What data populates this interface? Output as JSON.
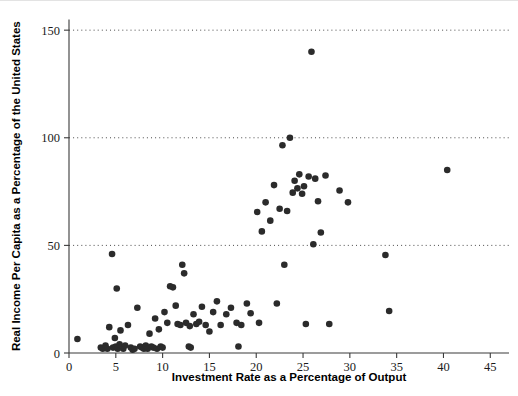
{
  "chart_data": {
    "type": "scatter",
    "title": "",
    "xlabel": "Investment Rate as a Percentage of Output",
    "ylabel": "Real Income Per Capita as a Percentage of the United States",
    "xlim": [
      0,
      47
    ],
    "ylim": [
      0,
      155
    ],
    "xticks": [
      0,
      5,
      10,
      15,
      20,
      25,
      30,
      35,
      40,
      45
    ],
    "yticks": [
      0,
      50,
      100,
      150
    ],
    "xtick_labels": [
      "0",
      "5",
      "10",
      "15",
      "20",
      "25",
      "30",
      "35",
      "40",
      "45"
    ],
    "ytick_labels": [
      "0",
      "50",
      "100",
      "150"
    ],
    "grid": "horizontal-dotted",
    "gridlines_at": [
      50,
      100,
      150
    ],
    "legend": "none",
    "marker": "filled-circle",
    "marker_color": "#2b2b2b",
    "marker_size": 4.6,
    "points": [
      [
        0.9,
        6.5
      ],
      [
        3.4,
        2.5
      ],
      [
        3.6,
        2.0
      ],
      [
        3.9,
        3.5
      ],
      [
        4.1,
        2.0
      ],
      [
        4.3,
        12.0
      ],
      [
        4.6,
        46.0
      ],
      [
        4.7,
        2.5
      ],
      [
        4.9,
        7.0
      ],
      [
        5.0,
        3.0
      ],
      [
        5.1,
        30.0
      ],
      [
        5.2,
        2.0
      ],
      [
        5.4,
        4.0
      ],
      [
        5.5,
        10.5
      ],
      [
        5.8,
        2.0
      ],
      [
        6.0,
        3.5
      ],
      [
        6.3,
        13.0
      ],
      [
        6.6,
        2.5
      ],
      [
        6.8,
        1.5
      ],
      [
        7.0,
        2.0
      ],
      [
        7.3,
        21.0
      ],
      [
        7.6,
        3.0
      ],
      [
        7.8,
        2.5
      ],
      [
        8.0,
        2.0
      ],
      [
        8.2,
        3.5
      ],
      [
        8.4,
        2.0
      ],
      [
        8.6,
        9.0
      ],
      [
        8.8,
        3.0
      ],
      [
        9.0,
        2.5
      ],
      [
        9.2,
        16.0
      ],
      [
        9.4,
        2.0
      ],
      [
        9.6,
        11.0
      ],
      [
        9.8,
        3.0
      ],
      [
        10.0,
        2.5
      ],
      [
        10.2,
        19.0
      ],
      [
        10.5,
        14.0
      ],
      [
        10.8,
        31.0
      ],
      [
        11.1,
        30.5
      ],
      [
        11.4,
        22.0
      ],
      [
        11.6,
        13.5
      ],
      [
        11.9,
        13.0
      ],
      [
        12.1,
        41.0
      ],
      [
        12.3,
        37.0
      ],
      [
        12.5,
        14.0
      ],
      [
        12.8,
        3.0
      ],
      [
        12.9,
        12.5
      ],
      [
        13.0,
        2.5
      ],
      [
        13.3,
        18.0
      ],
      [
        13.6,
        13.5
      ],
      [
        13.9,
        14.5
      ],
      [
        14.2,
        21.5
      ],
      [
        14.6,
        13.0
      ],
      [
        15.0,
        10.0
      ],
      [
        15.4,
        19.0
      ],
      [
        15.8,
        24.0
      ],
      [
        16.2,
        13.0
      ],
      [
        16.8,
        18.0
      ],
      [
        17.3,
        21.0
      ],
      [
        17.9,
        14.0
      ],
      [
        18.1,
        3.0
      ],
      [
        18.4,
        13.0
      ],
      [
        19.0,
        23.0
      ],
      [
        19.4,
        18.5
      ],
      [
        20.1,
        65.5
      ],
      [
        20.3,
        14.0
      ],
      [
        20.6,
        56.5
      ],
      [
        21.0,
        70.0
      ],
      [
        21.5,
        61.5
      ],
      [
        21.9,
        78.0
      ],
      [
        22.2,
        23.0
      ],
      [
        22.5,
        67.0
      ],
      [
        22.8,
        96.5
      ],
      [
        23.0,
        41.0
      ],
      [
        23.3,
        66.0
      ],
      [
        23.6,
        100.0
      ],
      [
        23.9,
        74.5
      ],
      [
        24.1,
        80.0
      ],
      [
        24.4,
        76.5
      ],
      [
        24.6,
        83.0
      ],
      [
        24.9,
        74.0
      ],
      [
        25.1,
        77.5
      ],
      [
        25.3,
        13.5
      ],
      [
        25.6,
        82.0
      ],
      [
        25.9,
        140.0
      ],
      [
        26.1,
        50.5
      ],
      [
        26.3,
        81.0
      ],
      [
        26.6,
        70.5
      ],
      [
        26.9,
        56.0
      ],
      [
        27.4,
        82.5
      ],
      [
        27.8,
        13.5
      ],
      [
        28.9,
        75.5
      ],
      [
        29.8,
        70.0
      ],
      [
        33.8,
        45.5
      ],
      [
        34.2,
        19.5
      ],
      [
        40.4,
        85.0
      ]
    ]
  }
}
